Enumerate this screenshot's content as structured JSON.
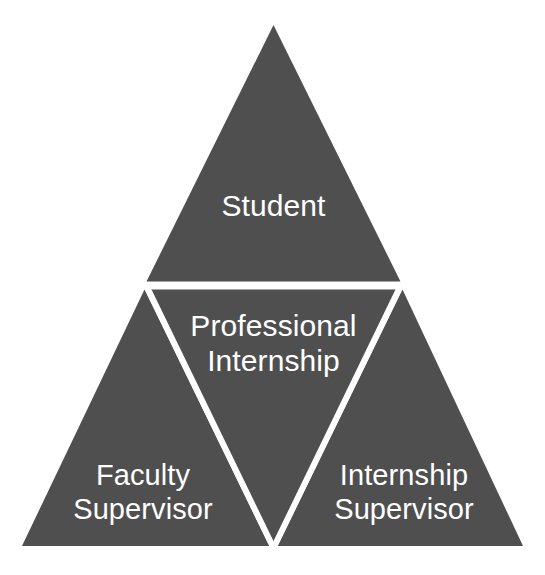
{
  "diagram": {
    "type": "segmented-triangle",
    "background_color": "#ffffff",
    "fill_color": "#4f4f4f",
    "divider_color": "#ffffff",
    "text_color": "#ffffff",
    "divider_width_px": 5,
    "segments": [
      {
        "id": "top",
        "role": "apex",
        "label_lines": [
          "Student"
        ],
        "label": "Student",
        "line1": "Student",
        "line2": ""
      },
      {
        "id": "center",
        "role": "center-inverted",
        "label_lines": [
          "Professional",
          "Internship"
        ],
        "label": "Professional Internship",
        "line1": "Professional",
        "line2": "Internship"
      },
      {
        "id": "bottom-left",
        "role": "left-corner",
        "label_lines": [
          "Faculty",
          "Supervisor"
        ],
        "label": "Faculty Supervisor",
        "line1": "Faculty",
        "line2": "Supervisor"
      },
      {
        "id": "bottom-right",
        "role": "right-corner",
        "label_lines": [
          "Internship",
          "Supervisor"
        ],
        "label": "Internship Supervisor",
        "line1": "Internship",
        "line2": "Supervisor"
      }
    ]
  }
}
